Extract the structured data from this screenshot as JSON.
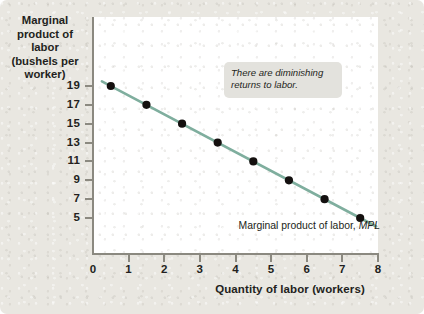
{
  "chart_data": {
    "type": "line",
    "title": "",
    "xlabel": "Quantity of labor (workers)",
    "ylabel": "Marginal product of labor (bushels per worker)",
    "ylabel_lines": [
      "Marginal",
      "product of labor",
      "(bushels per",
      "worker)"
    ],
    "x": [
      0.5,
      1.5,
      2.5,
      3.5,
      4.5,
      5.5,
      6.5,
      7.5
    ],
    "values": [
      19,
      17,
      15,
      13,
      11,
      9,
      7,
      5
    ],
    "series": [
      {
        "name": "Marginal product of labor, MPL",
        "x": [
          0.5,
          1.5,
          2.5,
          3.5,
          4.5,
          5.5,
          6.5,
          7.5
        ],
        "values": [
          19,
          17,
          15,
          13,
          11,
          9,
          7,
          5
        ]
      }
    ],
    "xlim": [
      0,
      8
    ],
    "ylim": [
      4,
      20
    ],
    "xticks": [
      0,
      1,
      2,
      3,
      4,
      5,
      6,
      7,
      8
    ],
    "yticks": [
      5,
      7,
      9,
      11,
      13,
      15,
      17,
      19
    ],
    "grid": false,
    "legend": "none",
    "line_color": "#7fae9e",
    "marker_color": "#14100f",
    "panel_color": "#ffffff",
    "background_color": "#e9e7e1",
    "axis_color": "#8b8980",
    "text_color": "#231f20",
    "annotations": [
      {
        "name": "diminishing-returns-callout",
        "text": "There are diminishing returns to labor.",
        "lines": [
          "There are diminishing",
          "returns to labor."
        ],
        "style": "italic",
        "box_color": "#e3e2dd"
      },
      {
        "name": "series-label",
        "text_plain": "Marginal product of labor, ",
        "text_italic": "MPL"
      }
    ],
    "line_endpoints": {
      "x_start": 0.25,
      "y_start": 19.5,
      "x_end": 7.95,
      "y_end": 4.1
    }
  }
}
